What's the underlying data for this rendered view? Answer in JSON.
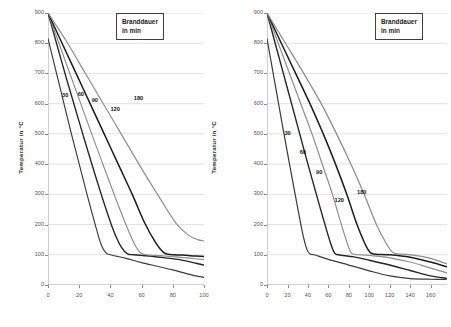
{
  "figure": {
    "background": "#ffffff",
    "grid_color": "#cfcfcf",
    "axis_color": "#8c8c8c",
    "tick_text_color": "#555555"
  },
  "panels": [
    {
      "id": "left",
      "y_axis": {
        "title": "Temperatur in °C",
        "ticks": [
          0,
          100,
          200,
          300,
          400,
          500,
          600,
          700,
          800,
          900
        ],
        "min": 0,
        "max": 900
      },
      "x_axis": {
        "title": "",
        "ticks": [
          0,
          20,
          40,
          60,
          80,
          100
        ],
        "min": 0,
        "max": 100
      },
      "legend": {
        "line1": "Branddauer",
        "line2": "in min"
      },
      "curve_labels": [
        {
          "text": "30",
          "x": 9,
          "y": 625
        },
        {
          "text": "60",
          "x": 19,
          "y": 628
        },
        {
          "text": "90",
          "x": 28,
          "y": 608
        },
        {
          "text": "120",
          "x": 40,
          "y": 580
        },
        {
          "text": "180",
          "x": 55,
          "y": 617
        }
      ]
    },
    {
      "id": "right",
      "y_axis": {
        "title": "Temperatur in °C",
        "ticks": [
          0,
          100,
          200,
          300,
          400,
          500,
          600,
          700,
          800,
          900
        ],
        "min": 0,
        "max": 900
      },
      "x_axis": {
        "title": "",
        "ticks": [
          0,
          20,
          40,
          60,
          80,
          100,
          120,
          140,
          160
        ],
        "min": 0,
        "max": 176
      },
      "legend": {
        "line1": "Branddauer",
        "line2": "in min"
      },
      "curve_labels": [
        {
          "text": "30",
          "x": 17,
          "y": 500
        },
        {
          "text": "60",
          "x": 32,
          "y": 437
        },
        {
          "text": "90",
          "x": 48,
          "y": 370
        },
        {
          "text": "120",
          "x": 66,
          "y": 277
        },
        {
          "text": "180",
          "x": 88,
          "y": 303
        }
      ]
    }
  ],
  "chart_data": [
    {
      "type": "line",
      "panel": "left",
      "title": "",
      "subtitle": "",
      "xlabel": "",
      "ylabel": "Temperatur in °C",
      "xlim": [
        0,
        100
      ],
      "ylim": [
        0,
        900
      ],
      "xticks": [
        0,
        20,
        40,
        60,
        80,
        100
      ],
      "yticks": [
        0,
        100,
        200,
        300,
        400,
        500,
        600,
        700,
        800,
        900
      ],
      "grid": "horizontal",
      "legend": "Branddauer in min",
      "legend_position": "top-right",
      "series": [
        {
          "name": "30",
          "color": "#3a3a3a",
          "width": 1.15,
          "points": [
            [
              0,
              815
            ],
            [
              5,
              710
            ],
            [
              10,
              605
            ],
            [
              15,
              500
            ],
            [
              20,
              400
            ],
            [
              25,
              300
            ],
            [
              30,
              205
            ],
            [
              34,
              135
            ],
            [
              37,
              107
            ],
            [
              40,
              100
            ],
            [
              50,
              88
            ],
            [
              60,
              74
            ],
            [
              70,
              62
            ],
            [
              80,
              50
            ],
            [
              90,
              36
            ],
            [
              100,
              25
            ]
          ]
        },
        {
          "name": "60",
          "color": "#262626",
          "width": 1.35,
          "points": [
            [
              0,
              900
            ],
            [
              6,
              790
            ],
            [
              12,
              680
            ],
            [
              18,
              575
            ],
            [
              24,
              470
            ],
            [
              30,
              368
            ],
            [
              36,
              270
            ],
            [
              42,
              180
            ],
            [
              47,
              125
            ],
            [
              51,
              103
            ],
            [
              55,
              100
            ],
            [
              65,
              96
            ],
            [
              75,
              90
            ],
            [
              85,
              83
            ],
            [
              95,
              72
            ],
            [
              100,
              66
            ]
          ]
        },
        {
          "name": "90",
          "color": "#8e8e8e",
          "width": 1.15,
          "points": [
            [
              0,
              900
            ],
            [
              7,
              800
            ],
            [
              14,
              700
            ],
            [
              21,
              600
            ],
            [
              28,
              500
            ],
            [
              35,
              402
            ],
            [
              42,
              305
            ],
            [
              49,
              212
            ],
            [
              55,
              140
            ],
            [
              59,
              108
            ],
            [
              63,
              100
            ],
            [
              72,
              97
            ],
            [
              82,
              93
            ],
            [
              92,
              88
            ],
            [
              100,
              84
            ]
          ]
        },
        {
          "name": "120",
          "color": "#1c1c1c",
          "width": 1.5,
          "points": [
            [
              0,
              900
            ],
            [
              9,
              800
            ],
            [
              18,
              700
            ],
            [
              27,
              600
            ],
            [
              36,
              500
            ],
            [
              45,
              400
            ],
            [
              54,
              300
            ],
            [
              62,
              205
            ],
            [
              69,
              140
            ],
            [
              74,
              108
            ],
            [
              78,
              101
            ],
            [
              86,
              99
            ],
            [
              94,
              96
            ],
            [
              100,
              94
            ]
          ]
        },
        {
          "name": "180",
          "color": "#8e8e8e",
          "width": 1.2,
          "points": [
            [
              0,
              900
            ],
            [
              12,
              805
            ],
            [
              24,
              700
            ],
            [
              36,
              595
            ],
            [
              48,
              490
            ],
            [
              60,
              385
            ],
            [
              72,
              285
            ],
            [
              82,
              205
            ],
            [
              90,
              165
            ],
            [
              96,
              150
            ],
            [
              100,
              146
            ]
          ]
        }
      ]
    },
    {
      "type": "line",
      "panel": "right",
      "title": "",
      "subtitle": "",
      "xlabel": "",
      "ylabel": "Temperatur in °C",
      "xlim": [
        0,
        176
      ],
      "ylim": [
        0,
        900
      ],
      "xticks": [
        0,
        20,
        40,
        60,
        80,
        100,
        120,
        140,
        160
      ],
      "yticks": [
        0,
        100,
        200,
        300,
        400,
        500,
        600,
        700,
        800,
        900
      ],
      "grid": "horizontal",
      "legend": "Branddauer in min",
      "legend_position": "top-right",
      "series": [
        {
          "name": "30",
          "color": "#3a3a3a",
          "width": 1.2,
          "points": [
            [
              0,
              815
            ],
            [
              5,
              720
            ],
            [
              10,
              625
            ],
            [
              15,
              530
            ],
            [
              20,
              437
            ],
            [
              25,
              345
            ],
            [
              30,
              255
            ],
            [
              35,
              168
            ],
            [
              39,
              118
            ],
            [
              42,
              103
            ],
            [
              46,
              100
            ],
            [
              60,
              85
            ],
            [
              80,
              66
            ],
            [
              100,
              47
            ],
            [
              120,
              30
            ],
            [
              140,
              21
            ],
            [
              160,
              19
            ],
            [
              176,
              19
            ]
          ]
        },
        {
          "name": "60",
          "color": "#262626",
          "width": 1.4,
          "points": [
            [
              0,
              900
            ],
            [
              8,
              800
            ],
            [
              16,
              700
            ],
            [
              24,
              600
            ],
            [
              32,
              500
            ],
            [
              40,
              400
            ],
            [
              48,
              303
            ],
            [
              56,
              208
            ],
            [
              62,
              140
            ],
            [
              66,
              106
            ],
            [
              70,
              100
            ],
            [
              85,
              93
            ],
            [
              100,
              82
            ],
            [
              120,
              66
            ],
            [
              140,
              48
            ],
            [
              160,
              30
            ],
            [
              176,
              22
            ]
          ]
        },
        {
          "name": "90",
          "color": "#8e8e8e",
          "width": 1.2,
          "points": [
            [
              0,
              900
            ],
            [
              11,
              800
            ],
            [
              22,
              700
            ],
            [
              33,
              600
            ],
            [
              44,
              500
            ],
            [
              54,
              400
            ],
            [
              64,
              300
            ],
            [
              72,
              208
            ],
            [
              78,
              143
            ],
            [
              82,
              108
            ],
            [
              86,
              101
            ],
            [
              100,
              98
            ],
            [
              120,
              90
            ],
            [
              140,
              76
            ],
            [
              160,
              56
            ],
            [
              176,
              40
            ]
          ]
        },
        {
          "name": "120",
          "color": "#1c1c1c",
          "width": 1.5,
          "points": [
            [
              0,
              900
            ],
            [
              14,
              800
            ],
            [
              28,
              700
            ],
            [
              42,
              600
            ],
            [
              55,
              500
            ],
            [
              67,
              400
            ],
            [
              78,
              300
            ],
            [
              88,
              200
            ],
            [
              96,
              135
            ],
            [
              101,
              107
            ],
            [
              106,
              102
            ],
            [
              120,
              100
            ],
            [
              140,
              92
            ],
            [
              160,
              76
            ],
            [
              176,
              60
            ]
          ]
        },
        {
          "name": "180",
          "color": "#8e8e8e",
          "width": 1.25,
          "points": [
            [
              0,
              900
            ],
            [
              18,
              800
            ],
            [
              36,
              700
            ],
            [
              53,
              600
            ],
            [
              68,
              500
            ],
            [
              82,
              400
            ],
            [
              95,
              300
            ],
            [
              107,
              200
            ],
            [
              117,
              135
            ],
            [
              123,
              108
            ],
            [
              128,
              103
            ],
            [
              140,
              100
            ],
            [
              158,
              90
            ],
            [
              176,
              70
            ]
          ]
        }
      ]
    }
  ]
}
